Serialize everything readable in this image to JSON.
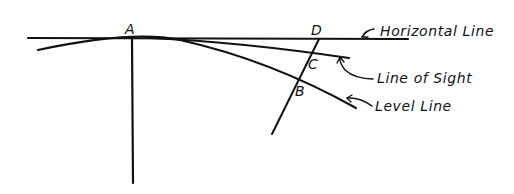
{
  "figure": {
    "type": "surveying-diagram",
    "points": {
      "A": "A",
      "B": "B",
      "C": "C",
      "D": "D"
    },
    "labels": {
      "horizontal_line": "Horizontal Line",
      "line_of_sight": "Line of Sight",
      "level_line": "Level Line"
    },
    "colors": {
      "ink": "#111111",
      "background": "#ffffff"
    }
  }
}
